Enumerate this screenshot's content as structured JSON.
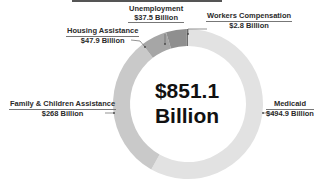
{
  "chart_data": {
    "type": "pie",
    "subtype": "donut",
    "title": "",
    "center_label": [
      "$851.1",
      "Billion"
    ],
    "total": 851.1,
    "unit": "Billion USD",
    "categories": [
      "Medicaid",
      "Family & Children Assistance",
      "Housing Assistance",
      "Unemployment",
      "Workers Compensation"
    ],
    "values": [
      494.9,
      268,
      47.9,
      37.5,
      2.8
    ],
    "value_labels": [
      "$494.9 Billion",
      "$268 Billion",
      "$47.9 Billion",
      "$37.5 Billion",
      "$2.8 Billion"
    ],
    "colors": [
      "#e2e2e2",
      "#c9c9c9",
      "#a6a6a6",
      "#8f8f8f",
      "#6f6f6f"
    ],
    "legend": "none (callout labels)",
    "grid": false
  },
  "labels": {
    "center_line1": "$851.1",
    "center_line2": "Billion",
    "medicaid": {
      "name": "Medicaid",
      "value": "$494.9 Billion"
    },
    "family": {
      "name": "Family & Children Assistance",
      "value": "$268 Billion"
    },
    "housing": {
      "name": "Housing Assistance",
      "value": "$47.9 Billion"
    },
    "unemployment": {
      "name": "Unemployment",
      "value": "$37.5 Billion"
    },
    "workers": {
      "name": "Workers Compensation",
      "value": "$2.8 Billion"
    }
  }
}
